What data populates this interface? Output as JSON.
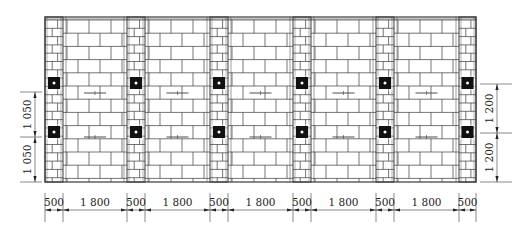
{
  "drawing": {
    "title": "Masonry wall elevation with constructional columns and tie bars",
    "wall": {
      "x0": 45,
      "y0": 17,
      "x1": 476,
      "y1": 182
    },
    "columns": [
      {
        "x": 45,
        "w": 18
      },
      {
        "x": 127,
        "w": 18
      },
      {
        "x": 210,
        "w": 18
      },
      {
        "x": 293,
        "w": 18
      },
      {
        "x": 376,
        "w": 18
      },
      {
        "x": 459,
        "w": 17
      }
    ],
    "tie_rows_y": [
      83,
      132
    ],
    "tie_marks_y": [
      93,
      137
    ],
    "colors": {
      "line": "#3a3a3a",
      "fill": "#111111",
      "background": "#ffffff"
    }
  },
  "dimensions": {
    "bottom": {
      "y": 210,
      "segments": [
        {
          "label": "500",
          "x0": 45,
          "x1": 63
        },
        {
          "label": "1 800",
          "x0": 63,
          "x1": 127
        },
        {
          "label": "500",
          "x0": 127,
          "x1": 145
        },
        {
          "label": "1 800",
          "x0": 145,
          "x1": 210
        },
        {
          "label": "500",
          "x0": 210,
          "x1": 228
        },
        {
          "label": "1 800",
          "x0": 228,
          "x1": 293
        },
        {
          "label": "500",
          "x0": 293,
          "x1": 311
        },
        {
          "label": "1 800",
          "x0": 311,
          "x1": 376
        },
        {
          "label": "500",
          "x0": 376,
          "x1": 394
        },
        {
          "label": "1 800",
          "x0": 394,
          "x1": 459
        },
        {
          "label": "500",
          "x0": 459,
          "x1": 476
        }
      ]
    },
    "left": {
      "x": 35,
      "segments": [
        {
          "label": "1 050",
          "y0": 92,
          "y1": 137
        },
        {
          "label": "1 050",
          "y0": 137,
          "y1": 182
        }
      ]
    },
    "right": {
      "x": 497,
      "segments": [
        {
          "label": "1 200",
          "y0": 84,
          "y1": 133
        },
        {
          "label": "1 200",
          "y0": 133,
          "y1": 182
        }
      ]
    }
  }
}
